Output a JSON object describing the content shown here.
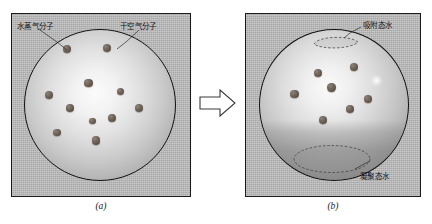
{
  "figure": {
    "panels": [
      {
        "id": "a",
        "caption": "(a)",
        "labels": [
          {
            "name": "water-vapor-molecule",
            "text": "水蒸气分子"
          },
          {
            "name": "dry-air-molecule",
            "text": "干空气分子"
          }
        ],
        "molecule_count": 11
      },
      {
        "id": "b",
        "caption": "(b)",
        "labels": [
          {
            "name": "adsorbed-water",
            "text": "吸附态水"
          },
          {
            "name": "condensed-water",
            "text": "凝聚态水"
          }
        ],
        "molecule_count": 7
      }
    ],
    "transition": {
      "name": "right-arrow",
      "symbol": "⇒"
    },
    "colors": {
      "panel_background": "#b8b8b8",
      "outline": "#1b1b1b",
      "molecule": "#6e6257",
      "sphere_highlight": "#fbfbfb",
      "sphere_edge": "#939393",
      "condensed_shade": "#787878",
      "page_background": "#ffffff"
    },
    "molecules_a": [
      {
        "x": 43.5,
        "y": 20.5,
        "r": 4.0
      },
      {
        "x": 84.0,
        "y": 20.0,
        "r": 4.2
      },
      {
        "x": 65.5,
        "y": 55.0,
        "r": 4.2
      },
      {
        "x": 26.0,
        "y": 66.5,
        "r": 4.0
      },
      {
        "x": 97.5,
        "y": 63.5,
        "r": 3.8
      },
      {
        "x": 47.0,
        "y": 80.0,
        "r": 3.8
      },
      {
        "x": 115.5,
        "y": 80.0,
        "r": 4.0
      },
      {
        "x": 88.5,
        "y": 89.5,
        "r": 4.0
      },
      {
        "x": 34.0,
        "y": 104.5,
        "r": 3.8
      },
      {
        "x": 73.0,
        "y": 112.5,
        "r": 4.2
      },
      {
        "x": 69.5,
        "y": 93.0,
        "r": 3.2
      }
    ],
    "molecules_b": [
      {
        "x": 60.0,
        "y": 45.0,
        "r": 4.0
      },
      {
        "x": 96.0,
        "y": 39.0,
        "r": 4.2
      },
      {
        "x": 73.5,
        "y": 59.5,
        "r": 4.2
      },
      {
        "x": 36.5,
        "y": 66.0,
        "r": 4.2
      },
      {
        "x": 110.0,
        "y": 70.5,
        "r": 4.0
      },
      {
        "x": 91.5,
        "y": 80.5,
        "r": 4.0
      },
      {
        "x": 65.0,
        "y": 91.5,
        "r": 4.0
      }
    ]
  }
}
